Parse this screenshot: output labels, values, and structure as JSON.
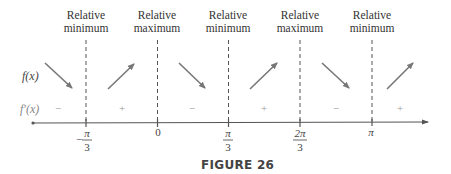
{
  "figure": {
    "caption": "FIGURE 26",
    "row_labels": {
      "function": "f(x)",
      "derivative": "f′(x)"
    },
    "colors": {
      "arrow": "#777777",
      "dashed_line": "#555555",
      "axis": "#555555",
      "sign_text": "#999999",
      "heading_text": "#333333"
    },
    "critical_points": [
      {
        "x_label": "-π/3",
        "numerator": "π",
        "denominator": "3",
        "negative": true,
        "heading_line1": "Relative",
        "heading_line2": "minimum"
      },
      {
        "x_label": "0",
        "numerator": "0",
        "denominator": "",
        "negative": false,
        "heading_line1": "Relative",
        "heading_line2": "maximum"
      },
      {
        "x_label": "π/3",
        "numerator": "π",
        "denominator": "3",
        "negative": false,
        "heading_line1": "Relative",
        "heading_line2": "minimum"
      },
      {
        "x_label": "2π/3",
        "numerator": "2π",
        "denominator": "3",
        "negative": false,
        "heading_line1": "Relative",
        "heading_line2": "maximum"
      },
      {
        "x_label": "π",
        "numerator": "π",
        "denominator": "",
        "negative": false,
        "heading_line1": "Relative",
        "heading_line2": "minimum"
      }
    ],
    "intervals": [
      {
        "sign": "−",
        "behavior": "decreasing"
      },
      {
        "sign": "+",
        "behavior": "increasing"
      },
      {
        "sign": "−",
        "behavior": "decreasing"
      },
      {
        "sign": "+",
        "behavior": "increasing"
      },
      {
        "sign": "−",
        "behavior": "decreasing"
      },
      {
        "sign": "+",
        "behavior": "increasing"
      }
    ]
  }
}
